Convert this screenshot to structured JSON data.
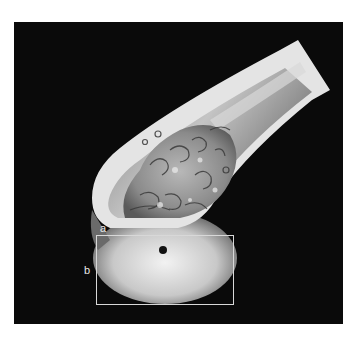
{
  "figure": {
    "type": "micro-CT 3D rendering of femoral head (sectioned)",
    "background_color": "#0a0a0a",
    "labels": {
      "a": "a",
      "b": "b"
    },
    "roi_box": {
      "left": 96,
      "top": 235,
      "width": 138,
      "height": 70,
      "color": "#d8d8d8"
    },
    "marker_dot": {
      "cx": 163,
      "cy": 250,
      "r": 4,
      "color": "#111111"
    }
  }
}
